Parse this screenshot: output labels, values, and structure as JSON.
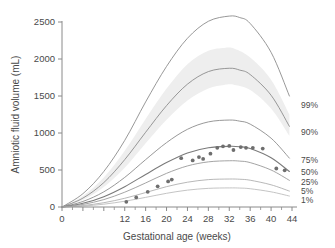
{
  "chart_data": {
    "type": "line",
    "title": "",
    "xlabel": "Gestational age (weeks)",
    "ylabel": "Amniotic fluid volume (mL)",
    "xlim": [
      0,
      44
    ],
    "ylim": [
      0,
      2500
    ],
    "grid": false,
    "legend_position": "right-inline",
    "x_ticks": [
      0,
      4,
      8,
      12,
      16,
      20,
      24,
      28,
      32,
      36,
      40,
      44
    ],
    "x_tick_labels": [
      "0",
      "",
      "",
      "12",
      "16",
      "20",
      "24",
      "28",
      "32",
      "36",
      "40",
      "44"
    ],
    "x_minor_ticks": [
      2,
      6,
      10,
      14,
      18,
      22,
      26,
      30,
      34,
      38,
      42
    ],
    "y_ticks": [
      0,
      500,
      1000,
      1500,
      2000,
      2500
    ],
    "y_tick_labels": [
      "0",
      "500",
      "1000",
      "1500",
      "2000",
      "2500"
    ],
    "series": [
      {
        "name": "99%",
        "label": "99%",
        "color": "#8c8c8c",
        "x": [
          0,
          4,
          8,
          12,
          16,
          20,
          24,
          28,
          32,
          34,
          36,
          40,
          43.5
        ],
        "values": [
          0,
          180,
          480,
          900,
          1420,
          1900,
          2280,
          2510,
          2580,
          2560,
          2480,
          2090,
          1500
        ]
      },
      {
        "name": "90%",
        "label": "90%",
        "color": "#8c8c8c",
        "x": [
          0,
          4,
          8,
          12,
          16,
          20,
          24,
          28,
          32,
          34,
          36,
          40,
          43.5
        ],
        "values": [
          0,
          120,
          330,
          640,
          1010,
          1370,
          1660,
          1830,
          1875,
          1850,
          1790,
          1510,
          1090
        ]
      },
      {
        "name": "75%",
        "label": "75%",
        "color": "#8c8c8c",
        "x": [
          0,
          4,
          8,
          12,
          16,
          20,
          24,
          28,
          32,
          34,
          36,
          40,
          43.5
        ],
        "values": [
          0,
          75,
          205,
          400,
          640,
          870,
          1050,
          1150,
          1175,
          1160,
          1120,
          930,
          660
        ]
      },
      {
        "name": "50%",
        "label": "50%",
        "color": "#7a7a7a",
        "x": [
          0,
          4,
          8,
          12,
          16,
          20,
          24,
          28,
          32,
          34,
          36,
          40,
          43.5
        ],
        "values": [
          0,
          50,
          140,
          275,
          440,
          600,
          730,
          800,
          820,
          815,
          790,
          665,
          480
        ]
      },
      {
        "name": "25%",
        "label": "25%",
        "color": "#9a9a9a",
        "x": [
          0,
          4,
          8,
          12,
          16,
          20,
          24,
          28,
          32,
          34,
          36,
          40,
          43.5
        ],
        "values": [
          0,
          35,
          100,
          200,
          325,
          455,
          555,
          610,
          625,
          620,
          600,
          500,
          360
        ]
      },
      {
        "name": "5%",
        "label": "5%",
        "color": "#b0b0b0",
        "x": [
          0,
          4,
          8,
          12,
          16,
          20,
          24,
          28,
          32,
          34,
          36,
          40,
          43.5
        ],
        "values": [
          0,
          20,
          58,
          118,
          195,
          275,
          335,
          370,
          378,
          375,
          362,
          300,
          215
        ]
      },
      {
        "name": "1%",
        "label": "1%",
        "color": "#bdbdbd",
        "x": [
          0,
          4,
          8,
          12,
          16,
          20,
          24,
          28,
          32,
          34,
          36,
          40,
          43.5
        ],
        "values": [
          0,
          13,
          38,
          78,
          130,
          185,
          228,
          252,
          258,
          256,
          247,
          205,
          148
        ]
      }
    ],
    "shaded_band": {
      "name": "confidence-band",
      "color": "#eeeeee",
      "x": [
        0,
        4,
        8,
        12,
        16,
        20,
        24,
        28,
        31,
        33,
        36,
        40,
        43.5
      ],
      "upper": [
        0,
        150,
        400,
        760,
        1190,
        1600,
        1930,
        2110,
        2150,
        2140,
        2020,
        1720,
        1250
      ],
      "lower": [
        0,
        95,
        270,
        530,
        860,
        1180,
        1440,
        1600,
        1650,
        1650,
        1580,
        1330,
        960
      ]
    },
    "scatter": {
      "name": "observed-means",
      "marker": "circle",
      "color": "#6e6e6e",
      "points": [
        {
          "x": 12.3,
          "y": 70
        },
        {
          "x": 14.2,
          "y": 130
        },
        {
          "x": 16.4,
          "y": 205
        },
        {
          "x": 18.3,
          "y": 280
        },
        {
          "x": 20.3,
          "y": 345
        },
        {
          "x": 21.0,
          "y": 370
        },
        {
          "x": 22.8,
          "y": 660
        },
        {
          "x": 25.0,
          "y": 630
        },
        {
          "x": 26.2,
          "y": 675
        },
        {
          "x": 27.0,
          "y": 650
        },
        {
          "x": 28.4,
          "y": 720
        },
        {
          "x": 29.7,
          "y": 800
        },
        {
          "x": 30.8,
          "y": 820
        },
        {
          "x": 32.0,
          "y": 825
        },
        {
          "x": 32.8,
          "y": 770
        },
        {
          "x": 34.2,
          "y": 810
        },
        {
          "x": 35.2,
          "y": 800
        },
        {
          "x": 36.5,
          "y": 800
        },
        {
          "x": 38.4,
          "y": 790
        },
        {
          "x": 41.0,
          "y": 520
        },
        {
          "x": 42.6,
          "y": 495
        }
      ]
    }
  }
}
